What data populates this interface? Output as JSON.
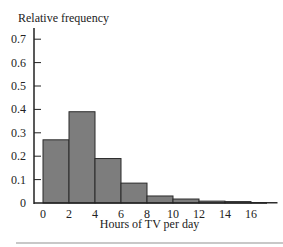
{
  "chart_data": {
    "type": "bar",
    "title": "",
    "ylabel": "Relative frequency",
    "xlabel": "Hours of TV per day",
    "bin_edges": [
      0,
      2,
      4,
      6,
      8,
      10,
      12,
      14,
      16,
      18
    ],
    "categories": [
      "0-2",
      "2-4",
      "4-6",
      "6-8",
      "8-10",
      "10-12",
      "12-14",
      "14-16",
      "16-18"
    ],
    "values": [
      0.27,
      0.39,
      0.19,
      0.085,
      0.03,
      0.017,
      0.008,
      0.006,
      0.002
    ],
    "xticks": [
      "0",
      "2",
      "4",
      "6",
      "8",
      "10",
      "12",
      "14",
      "16"
    ],
    "yticks": [
      "0",
      "0.1",
      "0.2",
      "0.3",
      "0.4",
      "0.5",
      "0.6",
      "0.7"
    ],
    "ylim": [
      0,
      0.75
    ],
    "grid": false,
    "legend": null,
    "bar_color": "#7d7d7d"
  }
}
